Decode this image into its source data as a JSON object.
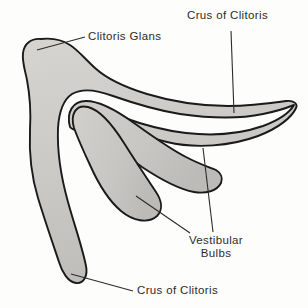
{
  "figure": {
    "type": "anatomical-line-drawing",
    "background_color": "#fdfdfc",
    "outline_color": "#1a1a1a",
    "fill_color": "#cbc9c6",
    "leader_color": "#2b2b2b"
  },
  "labels": {
    "crus_upper": "Crus of Clitoris",
    "glans": "Clitoris Glans",
    "vestibular_bulbs_line1": "Vestibular",
    "vestibular_bulbs_line2": "Bulbs",
    "crus_lower": "Crus of Clitoris"
  },
  "structures": [
    {
      "name": "clitoris-glans",
      "label": "Clitoris Glans",
      "description": "Rounded knob at upper-left of the shaft"
    },
    {
      "name": "crus-upper",
      "label": "Crus of Clitoris",
      "description": "Elongated tapering arm extending to the right"
    },
    {
      "name": "crus-lower",
      "label": "Crus of Clitoris",
      "description": "Broad band descending to lower-left with rounded tip"
    },
    {
      "name": "vestibular-bulb-upper",
      "label": "Vestibular Bulbs",
      "description": "Elongated bulb beneath the body of the clitoris"
    },
    {
      "name": "vestibular-bulb-lower",
      "label": "Vestibular Bulbs",
      "description": "Pear-shaped bulb below the upper bulb"
    }
  ]
}
